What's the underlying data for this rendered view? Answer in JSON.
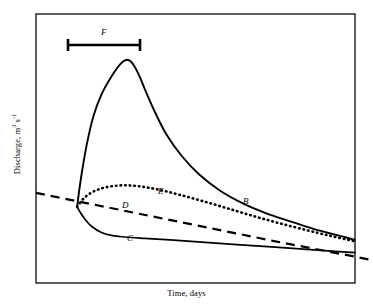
{
  "figure": {
    "background_color": "#ffffff",
    "frame_color": "#1a1a1a",
    "curve_color": "#000000"
  },
  "axes": {
    "ylabel_text": "Discharge, m",
    "ylabel_unit_exp1": "3",
    "ylabel_unit_mid": " s",
    "ylabel_unit_exp2": "-1",
    "ylabel_full": "Discharge, m3 s-1",
    "xlabel": "Time, days"
  },
  "annotations": {
    "duration_bar": {
      "label": "F",
      "x_start": 68,
      "x_end": 140,
      "y": 45
    },
    "curve_labels": [
      {
        "id": "B",
        "label": "B",
        "x": 243,
        "y": 196
      },
      {
        "id": "C",
        "label": "C",
        "x": 127,
        "y": 233
      },
      {
        "id": "D",
        "label": "D",
        "x": 122,
        "y": 200
      },
      {
        "id": "E",
        "label": "E",
        "x": 158,
        "y": 186
      }
    ]
  },
  "chart_data": {
    "type": "line",
    "title": "",
    "xlabel": "Time, days",
    "ylabel": "Discharge, m3 s-1",
    "xlim": [
      0,
      100
    ],
    "ylim": [
      0,
      100
    ],
    "grid": false,
    "legend": "none",
    "axis_ticks": false,
    "series": [
      {
        "name": "B",
        "label": "B",
        "style": "solid",
        "description": "Storm hydrograph: sharp rising limb to peak then long exponential recession",
        "points": [
          [
            12.9,
            28.3
          ],
          [
            13.5,
            34.0
          ],
          [
            14.5,
            42.0
          ],
          [
            16.0,
            52.0
          ],
          [
            18.0,
            62.0
          ],
          [
            20.5,
            70.0
          ],
          [
            23.5,
            76.5
          ],
          [
            26.5,
            81.5
          ],
          [
            28.5,
            83.0
          ],
          [
            30.0,
            82.0
          ],
          [
            32.0,
            78.0
          ],
          [
            34.5,
            71.0
          ],
          [
            37.5,
            63.0
          ],
          [
            41.0,
            55.0
          ],
          [
            45.5,
            47.5
          ],
          [
            51.0,
            40.5
          ],
          [
            57.5,
            34.5
          ],
          [
            65.0,
            29.5
          ],
          [
            72.0,
            26.0
          ],
          [
            79.5,
            23.0
          ],
          [
            86.0,
            20.5
          ],
          [
            92.0,
            18.5
          ],
          [
            97.0,
            17.0
          ],
          [
            100.0,
            16.0
          ]
        ]
      },
      {
        "name": "C",
        "label": "C",
        "style": "solid",
        "description": "Depressed response: falls below baseflow then slowly recedes",
        "points": [
          [
            12.9,
            28.3
          ],
          [
            14.0,
            26.0
          ],
          [
            15.5,
            23.5
          ],
          [
            17.5,
            21.0
          ],
          [
            20.5,
            18.8
          ],
          [
            24.0,
            17.6
          ],
          [
            28.0,
            17.1
          ],
          [
            34.0,
            16.6
          ],
          [
            42.0,
            16.0
          ],
          [
            52.0,
            15.2
          ],
          [
            63.0,
            14.3
          ],
          [
            75.0,
            13.3
          ],
          [
            86.0,
            12.4
          ],
          [
            95.0,
            11.7
          ],
          [
            100.0,
            11.3
          ]
        ]
      },
      {
        "name": "D",
        "label": "D",
        "style": "dashed",
        "description": "Extrapolated baseflow recession, straight declining line spanning full width and beyond right frame",
        "points": [
          [
            0.0,
            33.5
          ],
          [
            25.0,
            27.5
          ],
          [
            50.0,
            21.5
          ],
          [
            75.0,
            15.5
          ],
          [
            100.0,
            9.8
          ],
          [
            105.0,
            8.6
          ]
        ]
      },
      {
        "name": "E",
        "label": "E",
        "style": "dotted",
        "description": "Intermediate response: small rise above baseflow then gradual recession",
        "points": [
          [
            12.9,
            28.3
          ],
          [
            15.0,
            31.5
          ],
          [
            18.0,
            34.0
          ],
          [
            22.0,
            35.6
          ],
          [
            27.0,
            36.3
          ],
          [
            32.0,
            36.0
          ],
          [
            38.0,
            34.8
          ],
          [
            45.0,
            32.8
          ],
          [
            53.0,
            30.2
          ],
          [
            61.0,
            27.4
          ],
          [
            69.0,
            24.6
          ],
          [
            77.0,
            22.0
          ],
          [
            85.0,
            19.6
          ],
          [
            92.0,
            17.6
          ],
          [
            98.0,
            16.0
          ],
          [
            100.0,
            15.5
          ]
        ]
      }
    ]
  }
}
